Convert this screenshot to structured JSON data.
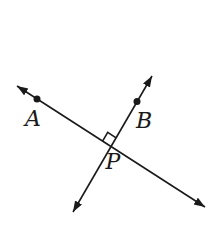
{
  "diagram": {
    "width": 220,
    "height": 225,
    "background_color": "#ffffff",
    "stroke_color": "#1a1a1a",
    "stroke_width": 1.6,
    "label_font_size": 22,
    "lines": [
      {
        "name": "line-through-A-and-P",
        "x1": 17,
        "y1": 86,
        "x2": 205,
        "y2": 207,
        "arrow_start": true,
        "arrow_end": true
      },
      {
        "name": "line-through-B-and-P",
        "x1": 152,
        "y1": 76,
        "x2": 73,
        "y2": 212,
        "arrow_start": true,
        "arrow_end": true
      }
    ],
    "points": [
      {
        "name": "point-A-dot",
        "x": 37,
        "y": 99,
        "r": 3.5
      },
      {
        "name": "point-B-dot",
        "x": 137,
        "y": 101.5,
        "r": 3.5
      }
    ],
    "right_angle_marker": {
      "name": "right-angle-marker",
      "path": "M 102.6 141.1 L 107.7 132.4 L 116.1 137.9"
    },
    "intersection": {
      "name": "point-P",
      "x": 111.1,
      "y": 146.5
    },
    "labels": [
      {
        "name": "label-A",
        "text": "A",
        "x": 33,
        "y": 126
      },
      {
        "name": "label-B",
        "text": "B",
        "x": 144,
        "y": 128
      },
      {
        "name": "label-P",
        "text": "P",
        "x": 113,
        "y": 169
      }
    ],
    "arrowhead": {
      "length": 11,
      "half_width": 4
    }
  }
}
